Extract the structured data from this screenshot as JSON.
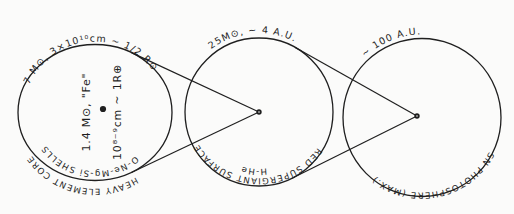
{
  "figure": {
    "ink_color": "#1f1f1f",
    "background_color": "#fbfbfa",
    "circles": [
      {
        "id": "heavy-element-core",
        "top_label": "7 M⊙, 3×10¹⁰cm ~ 1/2 R⊙",
        "bottom_outer_label": "HEAVY ELEMENT CORE",
        "bottom_inner_label": "O-Ne-Mg-Si SHELLS",
        "center_labels": [
          "1.4 M⊙, \"Fe\"",
          "10⁸⁻⁹cm ~ 1R⊕"
        ]
      },
      {
        "id": "red-supergiant",
        "top_label": "25M⊙, ~ 4 A.U.",
        "bottom_outer_label": "RED SUPERGIANT SURFACE",
        "bottom_inner_label": "H-He"
      },
      {
        "id": "sn-photosphere",
        "top_label": "~ 100 A.U.",
        "bottom_outer_label": "SN PHOTOSPHERE (MAX.)"
      }
    ]
  }
}
